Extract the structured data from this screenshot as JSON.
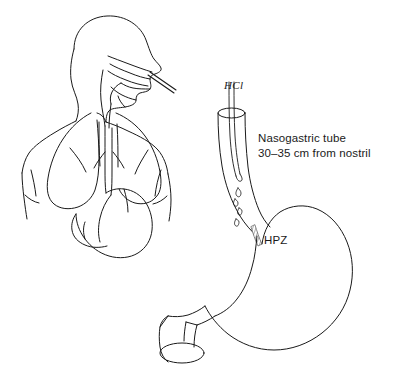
{
  "illustration": {
    "title": "Nasogastric tube placement and gastric high pressure zone",
    "background_color": "#ffffff",
    "line_color": "#1a1a1a",
    "stroke_width": 1.0
  },
  "labels": {
    "hcl": "HCl",
    "nasogastric_line1": "Nasogastric tube",
    "nasogastric_line2": "30–35 cm from nostril",
    "hpz": "HPZ"
  },
  "parts": {
    "body_outline": "body-outline",
    "head_profile": "head-profile",
    "nasal_passage": "nasal-passage",
    "pharynx": "pharynx",
    "lungs": "lungs",
    "trachea": "trachea",
    "small_stomach": "small-stomach",
    "esophagus": "esophagus",
    "nasogastric_tube": "nasogastric-tube",
    "acid_droplets": "acid-droplets",
    "high_pressure_zone": "high-pressure-zone",
    "stomach": "stomach",
    "duodenum": "duodenum"
  }
}
